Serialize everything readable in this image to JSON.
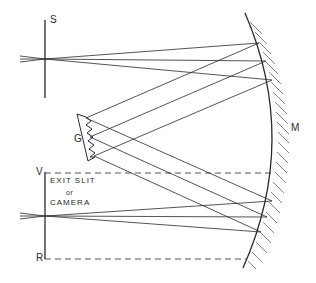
{
  "diagram": {
    "type": "Czerny-Turner / Ebert spectrograph optical layout",
    "labels": {
      "entrance_slit": "S",
      "grating": "G",
      "mirror": "M",
      "exit_top": "V",
      "exit_bottom": "R",
      "exit_line1": "EXIT SLIT",
      "exit_line2": "or",
      "exit_line3": "CAMERA"
    },
    "colors": {
      "line": "#2a2a2a",
      "background": "#ffffff"
    }
  }
}
